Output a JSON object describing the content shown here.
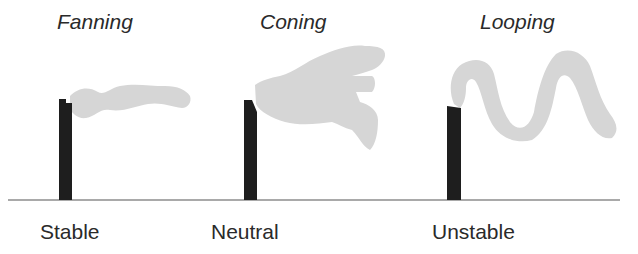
{
  "panels": [
    {
      "title": "Fanning",
      "stability": "Stable"
    },
    {
      "title": "Coning",
      "stability": "Neutral"
    },
    {
      "title": "Looping",
      "stability": "Unstable"
    }
  ],
  "colors": {
    "stack": "#1e1e1e",
    "plume": "#d6d6d6",
    "ground": "#555555",
    "text": "#2a2a2a"
  }
}
